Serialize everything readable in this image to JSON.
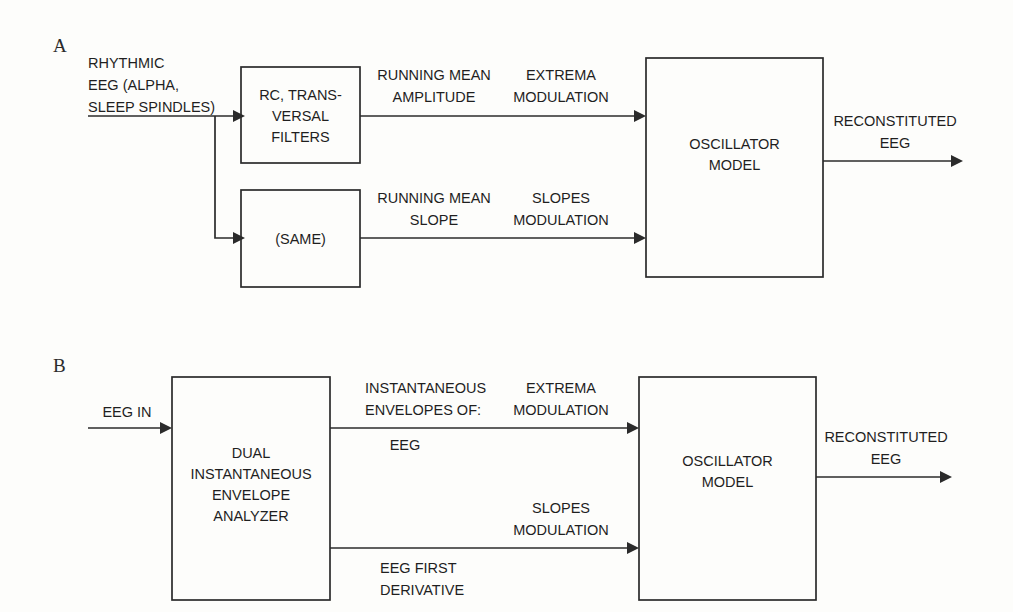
{
  "figure": {
    "type": "block-diagram",
    "background_color": "#fdfdfb",
    "stroke_color": "#2b2b2b",
    "text_color": "#1f1f1f"
  },
  "panels": [
    {
      "letter": "A",
      "input_label_lines": [
        "RHYTHMIC",
        "EEG (ALPHA,",
        "SLEEP SPINDLES)"
      ],
      "blocks": [
        {
          "id": "rc_filters",
          "lines": [
            "RC, TRANS-",
            "VERSAL",
            "FILTERS"
          ]
        },
        {
          "id": "same",
          "lines": [
            "(SAME)"
          ]
        },
        {
          "id": "oscillator",
          "lines": [
            "OSCILLATOR",
            "MODEL"
          ]
        }
      ],
      "signals": [
        {
          "id": "running_mean_amplitude",
          "lines": [
            "RUNNING MEAN",
            "AMPLITUDE"
          ]
        },
        {
          "id": "extrema_modulation_a",
          "lines": [
            "EXTREMA",
            "MODULATION"
          ]
        },
        {
          "id": "running_mean_slope",
          "lines": [
            "RUNNING MEAN",
            "SLOPE"
          ]
        },
        {
          "id": "slopes_modulation_a",
          "lines": [
            "SLOPES",
            "MODULATION"
          ]
        },
        {
          "id": "output_a",
          "lines": [
            "RECONSTITUTED",
            "EEG"
          ]
        }
      ]
    },
    {
      "letter": "B",
      "input_label_lines": [
        "EEG IN"
      ],
      "blocks": [
        {
          "id": "analyzer",
          "lines": [
            "DUAL",
            "INSTANTANEOUS",
            "ENVELOPE",
            "ANALYZER"
          ]
        },
        {
          "id": "oscillator",
          "lines": [
            "OSCILLATOR",
            "MODEL"
          ]
        }
      ],
      "signals": [
        {
          "id": "envelopes_of",
          "lines": [
            "INSTANTANEOUS",
            "ENVELOPES OF:"
          ]
        },
        {
          "id": "envelopes_eeg",
          "lines": [
            "EEG"
          ]
        },
        {
          "id": "extrema_modulation_b",
          "lines": [
            "EXTREMA",
            "MODULATION"
          ]
        },
        {
          "id": "eeg_first_derivative",
          "lines": [
            "EEG FIRST",
            "DERIVATIVE"
          ]
        },
        {
          "id": "slopes_modulation_b",
          "lines": [
            "SLOPES",
            "MODULATION"
          ]
        },
        {
          "id": "output_b",
          "lines": [
            "RECONSTITUTED",
            "EEG"
          ]
        }
      ]
    }
  ],
  "text": {
    "panel_a_letter": "A",
    "panel_b_letter": "B",
    "a_input_l1": "RHYTHMIC",
    "a_input_l2": "EEG (ALPHA,",
    "a_input_l3": "SLEEP SPINDLES)",
    "a_rc_l1": "RC, TRANS-",
    "a_rc_l2": "VERSAL",
    "a_rc_l3": "FILTERS",
    "a_same_l1": "(SAME)",
    "a_rma_l1": "RUNNING MEAN",
    "a_rma_l2": "AMPLITUDE",
    "a_extrema_l1": "EXTREMA",
    "a_extrema_l2": "MODULATION",
    "a_rms_l1": "RUNNING MEAN",
    "a_rms_l2": "SLOPE",
    "a_slopes_l1": "SLOPES",
    "a_slopes_l2": "MODULATION",
    "a_osc_l1": "OSCILLATOR",
    "a_osc_l2": "MODEL",
    "a_out_l1": "RECONSTITUTED",
    "a_out_l2": "EEG",
    "b_input_l1": "EEG IN",
    "b_analyzer_l1": "DUAL",
    "b_analyzer_l2": "INSTANTANEOUS",
    "b_analyzer_l3": "ENVELOPE",
    "b_analyzer_l4": "ANALYZER",
    "b_env_l1": "INSTANTANEOUS",
    "b_env_l2": "ENVELOPES OF:",
    "b_env_l3": "EEG",
    "b_extrema_l1": "EXTREMA",
    "b_extrema_l2": "MODULATION",
    "b_deriv_l1": "EEG FIRST",
    "b_deriv_l2": "DERIVATIVE",
    "b_slopes_l1": "SLOPES",
    "b_slopes_l2": "MODULATION",
    "b_osc_l1": "OSCILLATOR",
    "b_osc_l2": "MODEL",
    "b_out_l1": "RECONSTITUTED",
    "b_out_l2": "EEG"
  }
}
